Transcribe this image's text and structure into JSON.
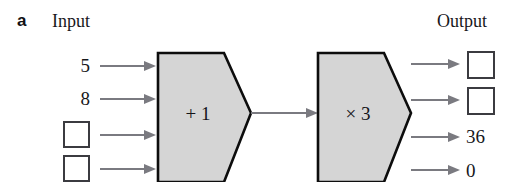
{
  "figure": {
    "panel_letter": "a",
    "width": 518,
    "height": 182,
    "background_color": "#ffffff"
  },
  "headings": {
    "input": "Input",
    "output": "Output"
  },
  "colors": {
    "machine_fill": "#d5d5d5",
    "machine_stroke": "#0d0d0d",
    "arrow": "#7a7a80",
    "box_stroke": "#3b3b40",
    "text": "#17171b"
  },
  "machines": [
    {
      "id": "machine-add-one",
      "label": "+ 1",
      "operation": "add",
      "operand": 1
    },
    {
      "id": "machine-times-three",
      "label": "× 3",
      "operation": "multiply",
      "operand": 3
    }
  ],
  "rows": [
    {
      "input": "5",
      "input_kind": "value",
      "output": "",
      "output_kind": "blank"
    },
    {
      "input": "8",
      "input_kind": "value",
      "output": "",
      "output_kind": "blank"
    },
    {
      "input": "",
      "input_kind": "blank",
      "output": "36",
      "output_kind": "value"
    },
    {
      "input": "",
      "input_kind": "blank",
      "output": "0",
      "output_kind": "value"
    }
  ],
  "connector": {
    "label": "",
    "from": "machine-add-one",
    "to": "machine-times-three"
  }
}
